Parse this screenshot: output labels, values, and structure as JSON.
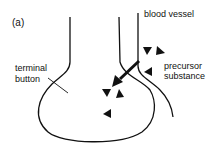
{
  "panel_label": "(a)",
  "labels": {
    "blood_vessel": "blood vessel",
    "precursor_line1": "precursor",
    "precursor_line2": "substance",
    "terminal_line1": "terminal",
    "terminal_line2": "button"
  },
  "colors": {
    "stroke": "#111111",
    "background": "#ffffff"
  }
}
